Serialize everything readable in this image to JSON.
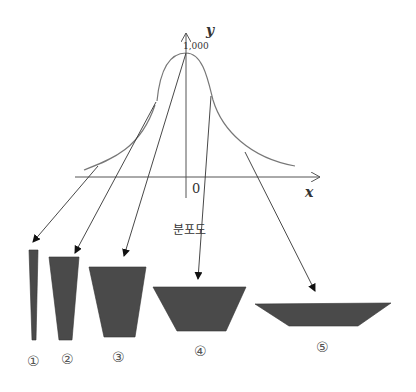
{
  "axes": {
    "y_label": "y",
    "x_label": "x",
    "origin_label": "0",
    "peak_value_label": "1,000"
  },
  "distribution_label": "분포도",
  "shapes": [
    {
      "id": "1",
      "label": "①"
    },
    {
      "id": "2",
      "label": "②"
    },
    {
      "id": "3",
      "label": "③"
    },
    {
      "id": "4",
      "label": "④"
    },
    {
      "id": "5",
      "label": "⑤"
    }
  ],
  "colors": {
    "shape_fill": "#4a4a4a",
    "line": "#555555",
    "curve": "#666666"
  }
}
